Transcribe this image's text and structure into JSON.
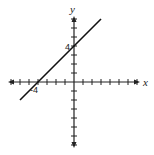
{
  "chart_data": {
    "type": "line",
    "title": "",
    "xlabel": "x",
    "ylabel": "y",
    "xlim": [
      -7,
      7
    ],
    "ylim": [
      -7,
      7
    ],
    "grid": false,
    "tick_interval": 1,
    "labeled_ticks": {
      "x": [
        -4
      ],
      "y": [
        4
      ]
    },
    "series": [
      {
        "name": "line",
        "x": [
          -6,
          3
        ],
        "y": [
          -2,
          7
        ],
        "equation": "y = x + 4"
      }
    ],
    "annotations": [
      "-4",
      "4"
    ]
  },
  "labels": {
    "x_axis": "x",
    "y_axis": "y",
    "x_intercept": "-4",
    "y_intercept": "4"
  }
}
